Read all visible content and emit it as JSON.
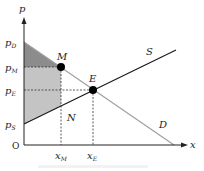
{
  "diagram": {
    "type": "supply-demand",
    "axes": {
      "y_label": "p",
      "x_label": "x",
      "origin_label": "O"
    },
    "y_ticks": [
      {
        "base": "p",
        "sub": "D"
      },
      {
        "base": "p",
        "sub": "M"
      },
      {
        "base": "p",
        "sub": "E"
      },
      {
        "base": "p",
        "sub": "S"
      }
    ],
    "x_ticks": [
      {
        "base": "x",
        "sub": "M"
      },
      {
        "base": "x",
        "sub": "E"
      }
    ],
    "curves": {
      "supply_label": "S",
      "demand_label": "D"
    },
    "points": {
      "monopoly": "M",
      "equilibrium": "E"
    },
    "region_label": "N",
    "colors": {
      "dark_shade": "#8c8c8c",
      "light_shade": "#c4c4c4",
      "supply_line": "#1a1a1a",
      "demand_line": "#a0a0a0",
      "axis": "#222222"
    }
  }
}
